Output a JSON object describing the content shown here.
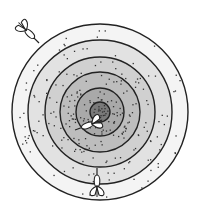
{
  "scene": {
    "title": "Dartboard target with darts",
    "center": [
      100,
      112
    ],
    "rings": [
      {
        "name": "ring-1-outer",
        "r": 88,
        "fill": "#f4f4f4",
        "dots": 40
      },
      {
        "name": "ring-2",
        "r": 72,
        "fill": "#e2e2e2",
        "dots": 45
      },
      {
        "name": "ring-3",
        "r": 55,
        "fill": "#d0d0d0",
        "dots": 50
      },
      {
        "name": "ring-4",
        "r": 40,
        "fill": "#bdbdbd",
        "dots": 60
      },
      {
        "name": "ring-5",
        "r": 24,
        "fill": "#a9a9a9",
        "dots": 40
      },
      {
        "name": "bullseye",
        "r": 10,
        "fill": "#7a7a7a",
        "dots": 20
      }
    ],
    "stroke": "#222222",
    "darts": [
      {
        "name": "dart-missed-top-left",
        "tip": [
          39,
          43
        ],
        "angle": 45
      },
      {
        "name": "dart-ring-3-lower-left",
        "tip": [
          75,
          130
        ],
        "angle": 160
      },
      {
        "name": "dart-ring-2-bottom",
        "tip": [
          97,
          168
        ],
        "angle": -90
      }
    ]
  }
}
